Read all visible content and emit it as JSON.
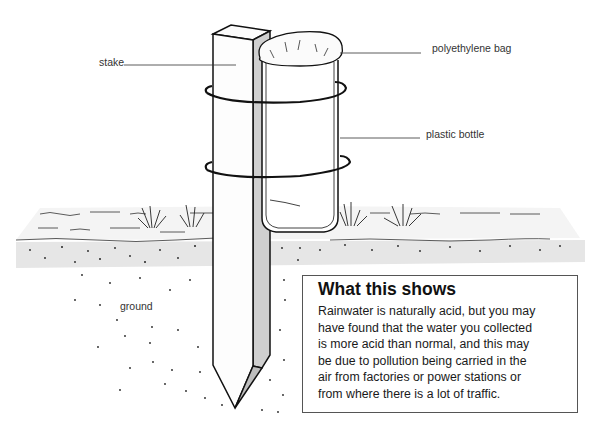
{
  "diagram": {
    "labels": {
      "stake": "stake",
      "polyethylene_bag": "polyethylene bag",
      "plastic_bottle": "plastic bottle",
      "ground": "ground"
    },
    "info_box": {
      "title": "What this shows",
      "lines": [
        "Rainwater is naturally acid, but you may",
        "have found that the water you collected",
        "is more acid than normal, and this may",
        "be due to pollution being carried in the",
        "air from factories or power stations or",
        "from where there is a lot of traffic."
      ]
    },
    "colors": {
      "line": "#111111",
      "shade": "#c8c8c8",
      "soil_band": "#e4e4e4",
      "box_border": "#555555"
    }
  }
}
